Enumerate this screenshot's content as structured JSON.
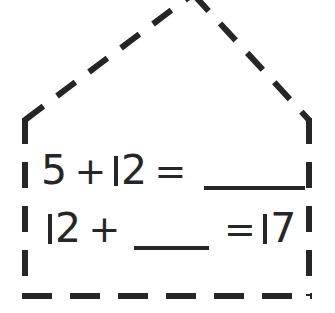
{
  "canvas": {
    "width": 335,
    "height": 313,
    "background_color": "#ffffff",
    "ink_color": "#262626"
  },
  "shape": {
    "name": "house-outline",
    "description": "dashed pentagon house shape",
    "stroke_color": "#262626",
    "stroke_width": 6,
    "dash_pattern": "22 16",
    "apex_clipped_at_top": true,
    "points": {
      "apex": [
        193,
        -6
      ],
      "left_eave": [
        25,
        120
      ],
      "right_eave": [
        309,
        120
      ],
      "left_base": [
        25,
        296
      ],
      "right_base": [
        309,
        296
      ]
    }
  },
  "worksheet": {
    "equations": [
      {
        "id": "equation-1",
        "text": "5 + 12 = ____",
        "left_operand": "5",
        "operator": "+",
        "right_operand": "12",
        "equals": "=",
        "result": "",
        "blank_position": "result"
      },
      {
        "id": "equation-2",
        "text": "12 + ____ = 17",
        "left_operand": "12",
        "operator": "+",
        "right_operand": "",
        "equals": "=",
        "result": "17",
        "blank_position": "right_operand"
      }
    ],
    "tokens": {
      "five": "5",
      "plus": "+",
      "equals": "=",
      "twelve_tens": "2",
      "seventeen_ones": "7"
    }
  }
}
